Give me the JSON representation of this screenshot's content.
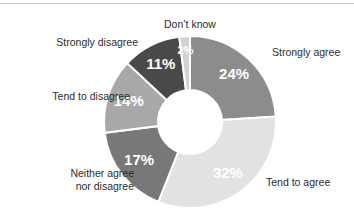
{
  "chart_data": {
    "type": "pie",
    "variant": "donut",
    "title": "",
    "subtitle": "",
    "xlabel": "",
    "ylabel": "",
    "legend_position": "outside-labels",
    "grid": false,
    "value_suffix": "%",
    "categories": [
      "Strongly agree",
      "Tend to agree",
      "Neither agree nor disagree",
      "Tend to disagree",
      "Strongly disagree",
      "Don't know"
    ],
    "values": [
      24,
      32,
      17,
      14,
      11,
      2
    ],
    "value_labels": [
      "24%",
      "32%",
      "17%",
      "14%",
      "11%",
      "2%"
    ],
    "colors": [
      "#8c8c8c",
      "#e2e2e2",
      "#787878",
      "#a8a8a8",
      "#494949",
      "#d2d2d2"
    ],
    "slices": [
      {
        "id": "strongly-agree",
        "label": "Strongly agree",
        "label_lines": [
          "Strongly agree"
        ],
        "value": 24,
        "value_label": "24%",
        "color": "#8c8c8c",
        "value_text_color": "#ffffff"
      },
      {
        "id": "tend-to-agree",
        "label": "Tend to agree",
        "label_lines": [
          "Tend to agree"
        ],
        "value": 32,
        "value_label": "32%",
        "color": "#e2e2e2",
        "value_text_color": "#ffffff"
      },
      {
        "id": "neither-agree-nor-disagree",
        "label": "Neither agree nor disagree",
        "label_lines": [
          "Neither agree",
          "nor disagree"
        ],
        "value": 17,
        "value_label": "17%",
        "color": "#787878",
        "value_text_color": "#ffffff"
      },
      {
        "id": "tend-to-disagree",
        "label": "Tend to disagree",
        "label_lines": [
          "Tend to disagree"
        ],
        "value": 14,
        "value_label": "14%",
        "color": "#a8a8a8",
        "value_text_color": "#ffffff"
      },
      {
        "id": "strongly-disagree",
        "label": "Strongly disagree",
        "label_lines": [
          "Strongly disagree"
        ],
        "value": 11,
        "value_label": "11%",
        "color": "#494949",
        "value_text_color": "#ffffff"
      },
      {
        "id": "dont-know",
        "label": "Don't know",
        "label_lines": [
          "Don’t know"
        ],
        "value": 2,
        "value_label": "2%",
        "color": "#d2d2d2",
        "value_text_color": "#ffffff"
      }
    ]
  },
  "labels": {
    "dont_know": "Don’t know",
    "strongly_agree": "Strongly agree",
    "tend_to_agree": "Tend to agree",
    "neither_line1": "Neither agree",
    "neither_line2": "nor disagree",
    "tend_to_disagree": "Tend to disagree",
    "strongly_disagree": "Strongly disagree"
  },
  "values": {
    "strongly_agree": "24%",
    "tend_to_agree": "32%",
    "neither": "17%",
    "tend_to_disagree": "14%",
    "strongly_disagree": "11%",
    "dont_know": "2%"
  },
  "style": {
    "background": "#ffffff",
    "separator": "#ffffff",
    "rule": "#c9c9c9",
    "label_text": "#2b2b2b"
  }
}
